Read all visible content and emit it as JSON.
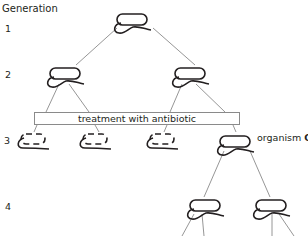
{
  "diagram": {
    "title": "Generation",
    "generations": [
      {
        "label": "1"
      },
      {
        "label": "2"
      },
      {
        "label": "3"
      },
      {
        "label": "4"
      }
    ],
    "treatment_label": "treatment with antibiotic",
    "organism_label_prefix": "organism ",
    "organism_label_id": "Q",
    "nodes": [
      {
        "generation": 1,
        "state": "alive"
      },
      {
        "generation": 2,
        "state": "alive"
      },
      {
        "generation": 2,
        "state": "alive"
      },
      {
        "generation": 3,
        "state": "dead"
      },
      {
        "generation": 3,
        "state": "dead"
      },
      {
        "generation": 3,
        "state": "dead"
      },
      {
        "generation": 3,
        "state": "alive",
        "label": "organism Q"
      },
      {
        "generation": 4,
        "state": "alive"
      },
      {
        "generation": 4,
        "state": "alive"
      }
    ],
    "colors": {
      "outline": "#231f20",
      "connector": "#8a8a8a",
      "box_border": "#8a8a8a"
    }
  }
}
